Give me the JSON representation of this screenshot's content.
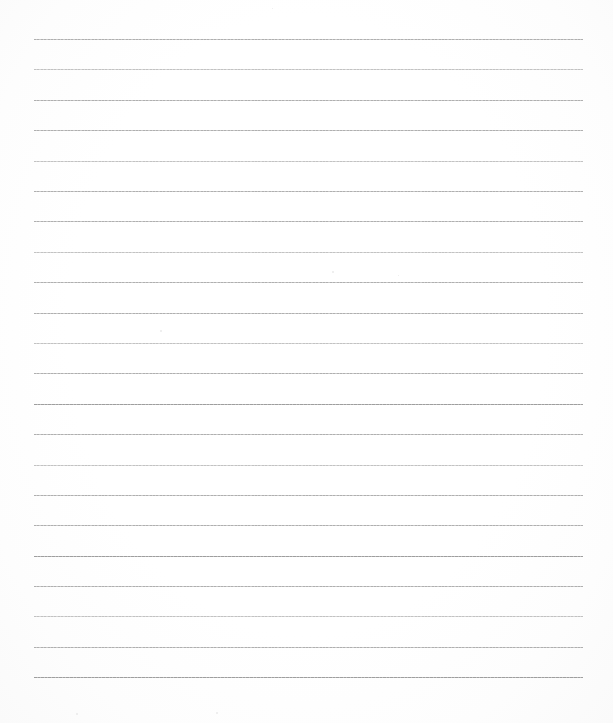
{
  "document": {
    "type": "lined-paper",
    "title": "Blank Lined Paper",
    "description": "Scanned blank ruled notebook page with no written content",
    "page_width": 613,
    "page_height": 723,
    "background_color": "#fefefe",
    "rule_color": "#b9b9b9",
    "content_text": ""
  },
  "ruling": {
    "line_count": 22,
    "line_spacing": 30.4,
    "first_line_y": 39,
    "last_line_y": 677,
    "left_margin_x": 34,
    "right_margin_x": 583,
    "line_width": 549,
    "line_thickness": 1,
    "top_blank_margin": 39,
    "bottom_blank_margin": 46,
    "margin_rule": "none",
    "lines": [
      {
        "index": 1,
        "y": 39,
        "weight": "normal"
      },
      {
        "index": 2,
        "y": 69,
        "weight": "soft"
      },
      {
        "index": 3,
        "y": 100,
        "weight": "normal"
      },
      {
        "index": 4,
        "y": 130,
        "weight": "normal"
      },
      {
        "index": 5,
        "y": 161,
        "weight": "soft"
      },
      {
        "index": 6,
        "y": 191,
        "weight": "normal"
      },
      {
        "index": 7,
        "y": 221,
        "weight": "normal"
      },
      {
        "index": 8,
        "y": 252,
        "weight": "soft"
      },
      {
        "index": 9,
        "y": 282,
        "weight": "normal"
      },
      {
        "index": 10,
        "y": 313,
        "weight": "normal"
      },
      {
        "index": 11,
        "y": 343,
        "weight": "soft"
      },
      {
        "index": 12,
        "y": 373,
        "weight": "normal"
      },
      {
        "index": 13,
        "y": 404,
        "weight": "dark"
      },
      {
        "index": 14,
        "y": 434,
        "weight": "normal"
      },
      {
        "index": 15,
        "y": 465,
        "weight": "soft"
      },
      {
        "index": 16,
        "y": 495,
        "weight": "normal"
      },
      {
        "index": 17,
        "y": 525,
        "weight": "normal"
      },
      {
        "index": 18,
        "y": 556,
        "weight": "dark"
      },
      {
        "index": 19,
        "y": 586,
        "weight": "normal"
      },
      {
        "index": 20,
        "y": 616,
        "weight": "soft"
      },
      {
        "index": 21,
        "y": 647,
        "weight": "normal"
      },
      {
        "index": 22,
        "y": 677,
        "weight": "dark"
      }
    ]
  },
  "specks": [
    {
      "x": 160,
      "y": 330,
      "size": 2
    },
    {
      "x": 332,
      "y": 271,
      "size": 2
    },
    {
      "x": 76,
      "y": 713,
      "size": 2
    },
    {
      "x": 216,
      "y": 712,
      "size": 2
    },
    {
      "x": 398,
      "y": 275,
      "size": 1
    },
    {
      "x": 272,
      "y": 8,
      "size": 1
    }
  ]
}
